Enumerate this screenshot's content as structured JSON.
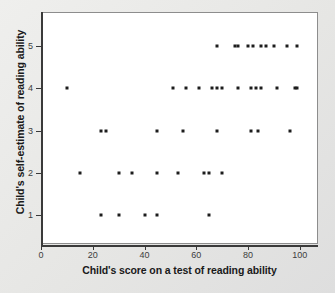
{
  "chart_data": {
    "type": "scatter",
    "title": "",
    "xlabel": "Child's score on a test of reading ability",
    "ylabel": "Child's self-estimate of reading ability",
    "xlim": [
      0,
      107
    ],
    "ylim": [
      0.3,
      5.8
    ],
    "grid": false,
    "legend": null,
    "marker": "square",
    "marker_color": "#1d1d1d",
    "xticks": [
      0,
      20,
      40,
      60,
      80,
      100
    ],
    "xticklabels": [
      "0",
      "20",
      "40",
      "60",
      "80",
      "100"
    ],
    "yticks": [
      1,
      2,
      3,
      4,
      5
    ],
    "yticklabels": [
      "1",
      "2",
      "3",
      "4",
      "5"
    ],
    "points": [
      {
        "x": 10,
        "y": 4
      },
      {
        "x": 15,
        "y": 2
      },
      {
        "x": 23,
        "y": 1
      },
      {
        "x": 23,
        "y": 3
      },
      {
        "x": 25,
        "y": 3
      },
      {
        "x": 30,
        "y": 1
      },
      {
        "x": 30,
        "y": 2
      },
      {
        "x": 35,
        "y": 2
      },
      {
        "x": 40,
        "y": 1
      },
      {
        "x": 45,
        "y": 1
      },
      {
        "x": 45,
        "y": 2
      },
      {
        "x": 45,
        "y": 3
      },
      {
        "x": 51,
        "y": 4
      },
      {
        "x": 53,
        "y": 2
      },
      {
        "x": 55,
        "y": 3
      },
      {
        "x": 56,
        "y": 4
      },
      {
        "x": 61,
        "y": 4
      },
      {
        "x": 63,
        "y": 2
      },
      {
        "x": 65,
        "y": 1
      },
      {
        "x": 65,
        "y": 2
      },
      {
        "x": 66,
        "y": 4
      },
      {
        "x": 68,
        "y": 3
      },
      {
        "x": 68,
        "y": 5
      },
      {
        "x": 68,
        "y": 4
      },
      {
        "x": 70,
        "y": 2
      },
      {
        "x": 70,
        "y": 4
      },
      {
        "x": 75,
        "y": 5
      },
      {
        "x": 76,
        "y": 5
      },
      {
        "x": 76,
        "y": 4
      },
      {
        "x": 80,
        "y": 5
      },
      {
        "x": 81,
        "y": 3
      },
      {
        "x": 81,
        "y": 4
      },
      {
        "x": 82,
        "y": 5
      },
      {
        "x": 83,
        "y": 4
      },
      {
        "x": 84,
        "y": 3
      },
      {
        "x": 85,
        "y": 4
      },
      {
        "x": 85,
        "y": 5
      },
      {
        "x": 87,
        "y": 5
      },
      {
        "x": 90,
        "y": 5
      },
      {
        "x": 91,
        "y": 4
      },
      {
        "x": 95,
        "y": 5
      },
      {
        "x": 96,
        "y": 3
      },
      {
        "x": 98,
        "y": 4
      },
      {
        "x": 99,
        "y": 4
      },
      {
        "x": 99,
        "y": 5
      }
    ]
  }
}
